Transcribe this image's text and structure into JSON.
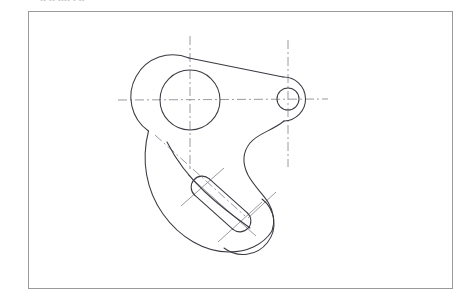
{
  "document": {
    "kind": "scanned-engineering-drawing",
    "subject": "bell crank lever plate",
    "background_color": "#ffffff",
    "top_text_remnant": "ıı ıı  ıııı   ı  ıı",
    "top_text_remnant_visible": "partially cropped line of text at top edge"
  },
  "frame": {
    "name": "drawing-border",
    "x": 28,
    "y": 11,
    "width": 424,
    "height": 277,
    "stroke_color": "#9a9a9e",
    "stroke_width": 1
  },
  "style": {
    "object_line_color": "#3a3a42",
    "object_line_width": 1.05,
    "center_line_color": "#8e8e96",
    "center_line_width": 0.9,
    "center_line_dash": "9 3 2 3",
    "hidden_line_color": "#9a9aa2"
  },
  "geometry": {
    "large_boss": {
      "name": "large-boss",
      "center_x": 190,
      "center_y": 100,
      "outer_radius": 42,
      "bore_radius": 30
    },
    "small_boss": {
      "name": "small-boss",
      "center_x": 288,
      "center_y": 99,
      "outer_radius": 22,
      "bore_radius": 11
    },
    "slot": {
      "name": "angled-slot",
      "end_a_x": 202,
      "end_a_y": 187,
      "end_b_x": 240,
      "end_b_y": 221,
      "radius": 11,
      "angle_deg": 42
    },
    "lower_lobe": {
      "name": "lower-lobe",
      "center_x": 246,
      "center_y": 220,
      "radius": 31
    },
    "outline_path": "M 151 67 C 132 92 128 124 137 155 C 146 187 166 214 190 234 C 206 247 226 251 243 247 C 262 242 276 226 277 208 C 278 196 273 186 266 179 C 256 169 247 160 243 150 C 238 138 241 126 250 117 C 259 108 270 103 277 99",
    "upper_tangent": {
      "name": "upper-tangent-edge",
      "x1": 189,
      "y1": 58,
      "x2": 288,
      "y2": 77
    },
    "lower_tangent": {
      "name": "lower-tangent-edge",
      "x1": 232,
      "y1": 138,
      "x2": 288,
      "y2": 121
    },
    "left_flank": {
      "name": "left-flank-edge",
      "x1": 163,
      "y1": 130,
      "x2": 214,
      "y2": 206
    }
  },
  "center_lines": [
    {
      "name": "horizontal-centerline-bores",
      "x1": 118,
      "y1": 100,
      "x2": 328,
      "y2": 99
    },
    {
      "name": "vertical-centerline-large-bore",
      "x1": 190,
      "y1": 36,
      "x2": 190,
      "y2": 170
    },
    {
      "name": "vertical-centerline-small-bore",
      "x1": 288,
      "y1": 40,
      "x2": 288,
      "y2": 167
    },
    {
      "name": "diagonal-centerline-to-slot",
      "x1": 155,
      "y1": 135,
      "x2": 245,
      "y2": 216
    },
    {
      "name": "slot-axis-centerline",
      "x1": 188,
      "y1": 175,
      "x2": 256,
      "y2": 236
    },
    {
      "name": "slot-end-a-cross",
      "x1": 181,
      "y1": 206,
      "x2": 224,
      "y2": 168
    },
    {
      "name": "slot-end-b-cross",
      "x1": 218,
      "y1": 242,
      "x2": 262,
      "y2": 202
    },
    {
      "name": "lower-lobe-cross-right",
      "x1": 276,
      "y1": 192,
      "x2": 248,
      "y2": 218
    }
  ]
}
